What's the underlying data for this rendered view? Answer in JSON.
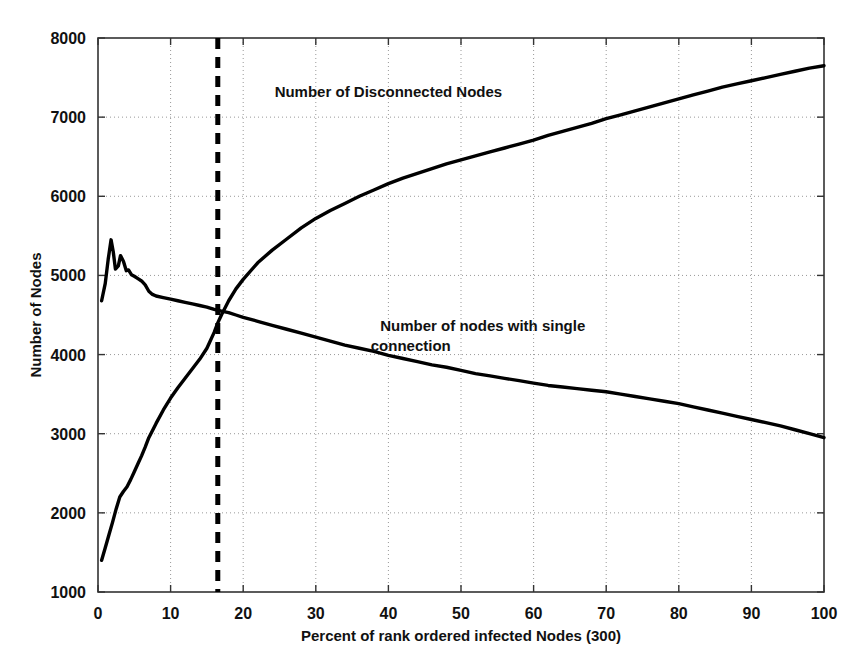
{
  "chart_data": {
    "type": "line",
    "title": "",
    "xlabel": "Percent of rank ordered infected Nodes (300)",
    "ylabel": "Number of Nodes",
    "xlim": [
      0,
      100
    ],
    "ylim": [
      1000,
      8000
    ],
    "xticks": [
      0,
      10,
      20,
      30,
      40,
      50,
      60,
      70,
      80,
      90,
      100
    ],
    "yticks": [
      1000,
      2000,
      3000,
      4000,
      5000,
      6000,
      7000,
      8000
    ],
    "xtick_labels": [
      "0",
      "10",
      "20",
      "30",
      "40",
      "50",
      "60",
      "70",
      "80",
      "90",
      "100"
    ],
    "ytick_labels": [
      "1000",
      "2000",
      "3000",
      "4000",
      "5000",
      "6000",
      "7000",
      "8000"
    ],
    "grid": true,
    "grid_style": "dotted",
    "grid_color": "#999999",
    "legend": "none",
    "line_color": "#000000",
    "series": [
      {
        "name": "Number of Disconnected Nodes",
        "annotation": "Number of Disconnected Nodes",
        "annotation_x": 40,
        "annotation_y": 7250,
        "x": [
          0.5,
          1,
          1.5,
          2,
          2.5,
          3,
          3.5,
          4,
          4.5,
          5,
          5.5,
          6,
          6.5,
          7,
          8,
          9,
          10,
          11,
          12,
          13,
          14,
          15,
          16,
          16.5,
          17,
          18,
          19,
          20,
          22,
          24,
          26,
          28,
          30,
          32,
          34,
          36,
          38,
          40,
          42,
          44,
          46,
          48,
          50,
          52,
          54,
          56,
          58,
          60,
          62,
          64,
          66,
          68,
          70,
          72,
          74,
          76,
          78,
          80,
          82,
          84,
          86,
          88,
          90,
          92,
          94,
          96,
          98,
          100
        ],
        "y": [
          1400,
          1560,
          1720,
          1880,
          2050,
          2200,
          2270,
          2330,
          2420,
          2520,
          2620,
          2720,
          2830,
          2950,
          3130,
          3300,
          3450,
          3580,
          3700,
          3820,
          3940,
          4080,
          4280,
          4400,
          4500,
          4680,
          4830,
          4950,
          5160,
          5320,
          5460,
          5600,
          5720,
          5820,
          5910,
          6000,
          6080,
          6160,
          6230,
          6290,
          6350,
          6410,
          6460,
          6510,
          6560,
          6610,
          6660,
          6710,
          6770,
          6820,
          6870,
          6920,
          6980,
          7030,
          7080,
          7130,
          7180,
          7230,
          7280,
          7330,
          7380,
          7420,
          7460,
          7500,
          7540,
          7580,
          7620,
          7650
        ]
      },
      {
        "name": "Number of nodes with single connection",
        "annotation": "Number of nodes with single\nconnection",
        "annotation_x": 53,
        "annotation_y": 4300,
        "x": [
          0.5,
          1,
          1.4,
          1.8,
          2.1,
          2.4,
          2.8,
          3.1,
          3.5,
          3.9,
          4.2,
          4.6,
          5,
          5.5,
          6,
          6.5,
          7,
          7.5,
          8,
          9,
          10,
          11,
          12,
          13,
          14,
          15,
          16,
          16.5,
          17,
          18,
          19,
          20,
          22,
          24,
          26,
          28,
          30,
          32,
          34,
          36,
          38,
          40,
          42,
          44,
          46,
          48,
          50,
          52,
          54,
          56,
          58,
          60,
          62,
          64,
          66,
          68,
          70,
          72,
          74,
          76,
          78,
          80,
          82,
          84,
          86,
          88,
          90,
          92,
          94,
          96,
          98,
          100
        ],
        "y": [
          4680,
          4900,
          5200,
          5450,
          5300,
          5080,
          5120,
          5250,
          5180,
          5060,
          5070,
          5010,
          4990,
          4960,
          4930,
          4880,
          4800,
          4760,
          4740,
          4720,
          4700,
          4680,
          4660,
          4640,
          4620,
          4600,
          4570,
          4560,
          4550,
          4530,
          4500,
          4470,
          4420,
          4370,
          4320,
          4270,
          4220,
          4170,
          4120,
          4080,
          4040,
          3990,
          3950,
          3910,
          3870,
          3840,
          3800,
          3760,
          3730,
          3700,
          3670,
          3640,
          3610,
          3590,
          3570,
          3550,
          3530,
          3500,
          3470,
          3440,
          3410,
          3380,
          3340,
          3300,
          3260,
          3220,
          3180,
          3140,
          3100,
          3050,
          3000,
          2950
        ]
      }
    ],
    "reference_lines": [
      {
        "name": "crossover-line",
        "orientation": "vertical",
        "x": 16.5,
        "style": "dashed",
        "color": "#000000",
        "width": 5
      }
    ],
    "crossover_point": {
      "x": 16.5,
      "y": 4560
    }
  }
}
